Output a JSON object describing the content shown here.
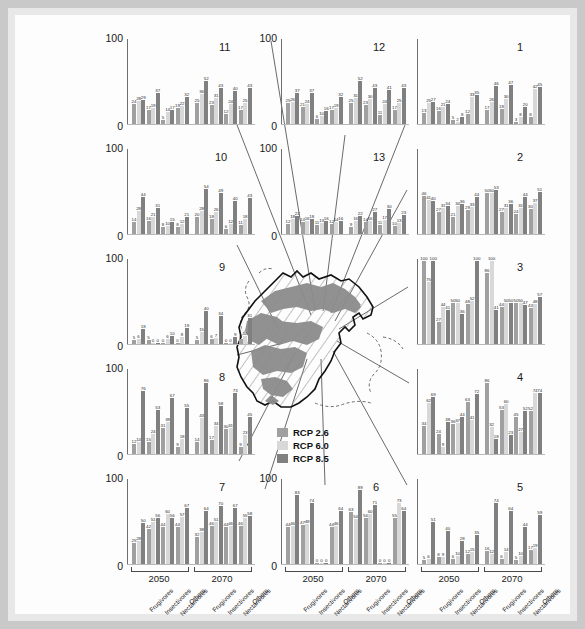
{
  "figure": {
    "y_axis_max_label": "100",
    "y_axis_min_label": "0",
    "period_labels": [
      "2050",
      "2070"
    ],
    "guild_labels": [
      "Frugivores",
      "Insectivores",
      "Nectarivores",
      "Others"
    ]
  },
  "legend": {
    "title": "",
    "items": [
      {
        "label": "RCP 2.6",
        "color": "#a0a0a0"
      },
      {
        "label": "RCP 6.0",
        "color": "#d8d8d8"
      },
      {
        "label": "RCP 8.5",
        "color": "#808080"
      }
    ]
  },
  "map": {
    "name": "region-outline-map",
    "shading": "hatched region with shaded subareas"
  },
  "chart_data": {
    "type": "bar",
    "title": "",
    "xlabel": "",
    "ylabel": "",
    "ylim": [
      0,
      100
    ],
    "grid": false,
    "legend_position": "center",
    "series_names": [
      "RCP 2.6",
      "RCP 6.0",
      "RCP 8.5"
    ],
    "categories": [
      "2050 Frugivores",
      "2050 Insectivores",
      "2050 Nectarivores",
      "2050 Others",
      "2070 Frugivores",
      "2070 Insectivores",
      "2070 Nectarivores",
      "2070 Others"
    ],
    "panels": [
      {
        "id": "1",
        "values": [
          [
            13,
            25,
            27,
            16,
            21,
            24,
            5,
            2,
            8,
            12,
            33,
            35,
            17,
            26,
            46,
            18,
            30,
            47,
            3,
            8,
            20,
            8,
            42,
            45
          ]
        ]
      },
      {
        "id": "2",
        "values": [
          [
            46,
            41,
            40,
            27,
            31,
            34,
            21,
            34,
            36,
            29,
            33,
            44,
            50,
            50,
            53,
            27,
            31,
            36,
            24,
            31,
            44,
            30,
            37,
            51
          ]
        ]
      },
      {
        "id": "3",
        "values": [
          [
            100,
            75,
            100,
            27,
            44,
            41,
            50,
            50,
            36,
            48,
            52,
            100,
            86,
            100,
            41,
            44,
            50,
            50,
            50,
            50,
            47,
            43,
            48,
            57
          ]
        ]
      },
      {
        "id": "4",
        "values": [
          [
            34,
            62,
            69,
            24,
            9,
            38,
            36,
            37,
            44,
            63,
            41,
            72,
            86,
            32,
            18,
            53,
            60,
            23,
            45,
            27,
            52,
            52,
            74,
            74
          ]
        ]
      },
      {
        "id": "5",
        "values": [
          [
            5,
            6,
            51,
            8,
            9,
            40,
            6,
            10,
            28,
            12,
            15,
            35,
            16,
            12,
            74,
            6,
            14,
            64,
            5,
            10,
            44,
            17,
            19,
            59
          ]
        ]
      },
      {
        "id": "6",
        "values": [
          [
            44,
            46,
            83,
            47,
            48,
            74,
            0,
            0,
            0,
            44,
            46,
            64,
            63,
            54,
            89,
            56,
            60,
            71,
            0,
            0,
            0,
            55,
            73,
            64
          ]
        ]
      },
      {
        "id": "7",
        "values": [
          [
            25,
            28,
            50,
            42,
            51,
            56,
            44,
            60,
            56,
            44,
            57,
            67,
            32,
            38,
            64,
            46,
            51,
            70,
            44,
            46,
            67,
            46,
            55,
            58
          ]
        ]
      },
      {
        "id": "8",
        "values": [
          [
            12,
            14,
            76,
            15,
            24,
            53,
            31,
            38,
            67,
            9,
            18,
            55,
            14,
            43,
            86,
            17,
            34,
            58,
            30,
            31,
            73,
            9,
            23,
            45
          ]
        ]
      },
      {
        "id": "9",
        "values": [
          [
            5,
            6,
            18,
            5,
            0,
            0,
            0,
            6,
            10,
            0,
            8,
            19,
            5,
            15,
            40,
            6,
            7,
            34,
            0,
            0,
            9,
            6,
            10,
            31
          ]
        ]
      },
      {
        "id": "10",
        "values": [
          [
            14,
            28,
            44,
            16,
            21,
            31,
            8,
            10,
            15,
            8,
            12,
            21,
            20,
            28,
            54,
            18,
            26,
            49,
            6,
            12,
            40,
            11,
            18,
            43
          ]
        ]
      },
      {
        "id": "11",
        "values": [
          [
            24,
            28,
            29,
            17,
            19,
            37,
            5,
            14,
            17,
            19,
            22,
            32,
            25,
            36,
            52,
            23,
            31,
            43,
            12,
            24,
            40,
            17,
            25,
            43
          ]
        ]
      },
      {
        "id": "12",
        "values": [
          [
            25,
            26,
            37,
            21,
            24,
            37,
            6,
            10,
            16,
            17,
            19,
            32,
            25,
            31,
            52,
            23,
            30,
            43,
            11,
            24,
            41,
            17,
            25,
            43
          ]
        ]
      },
      {
        "id": "13",
        "values": [
          [
            12,
            18,
            22,
            14,
            16,
            18,
            11,
            13,
            16,
            12,
            14,
            16,
            9,
            16,
            22,
            14,
            16,
            27,
            11,
            17,
            30,
            10,
            13,
            23
          ]
        ]
      }
    ]
  }
}
